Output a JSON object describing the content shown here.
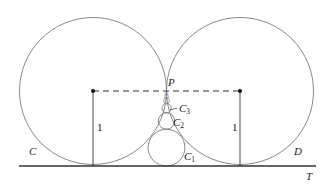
{
  "diagram": {
    "labels": {
      "circle_left": "C",
      "circle_right": "D",
      "line": "T",
      "point": "P",
      "radius_left": "1",
      "radius_right": "1",
      "c1_main": "C",
      "c1_sub": "1",
      "c2_main": "C",
      "c2_sub": "2",
      "c3_main": "C",
      "c3_sub": "3"
    },
    "colors": {
      "stroke": "#777777",
      "line": "#333333",
      "text": "#222222"
    }
  }
}
